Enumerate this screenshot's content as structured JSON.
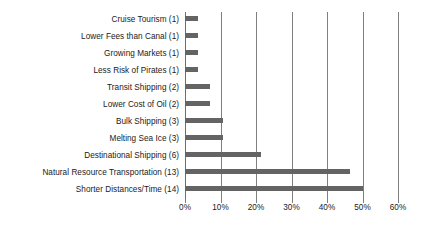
{
  "chart_data": {
    "type": "bar",
    "orientation": "horizontal",
    "title": "",
    "subtitle": "",
    "xlabel": "",
    "ylabel": "",
    "xlim": [
      0,
      60
    ],
    "x_tick_labels": [
      "0%",
      "10%",
      "20%",
      "30%",
      "40%",
      "50%",
      "60%"
    ],
    "x_tick_values": [
      0,
      10,
      20,
      30,
      40,
      50,
      60
    ],
    "grid": "vertical",
    "legend": "none",
    "total_responses": 28,
    "categories": [
      "Cruise Tourism (1)",
      "Lower Fees than Canal (1)",
      "Growing Markets (1)",
      "Less Risk of Pirates (1)",
      "Transit Shipping (2)",
      "Lower Cost of Oil (2)",
      "Bulk Shipping (3)",
      "Melting Sea Ice (3)",
      "Destinational Shipping (6)",
      "Natural Resource Transportation (13)",
      "Shorter Distances/Time (14)"
    ],
    "counts": [
      1,
      1,
      1,
      1,
      2,
      2,
      3,
      3,
      6,
      13,
      14
    ],
    "values": [
      3.6,
      3.6,
      3.6,
      3.6,
      7.1,
      7.1,
      10.7,
      10.7,
      21.4,
      46.4,
      50.0
    ],
    "value_labels": [
      "3.6%",
      "3.6%",
      "3.6%",
      "3.6%",
      "7.1%",
      "7.1%",
      "10.7%",
      "10.7%",
      "21.4%",
      "46.4%",
      "50.0%"
    ],
    "bar_color": "#646464",
    "gridline_color": "#7f7f7f",
    "background_color": "#ffffff",
    "text_color": "#1a1a1a"
  }
}
